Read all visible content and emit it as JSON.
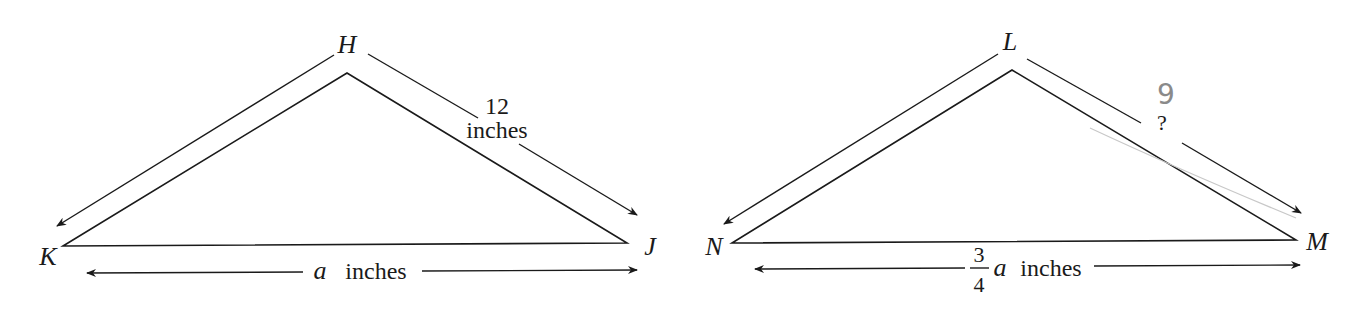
{
  "diagram": {
    "type": "similar-triangles",
    "triangles": [
      {
        "id": "HJK",
        "vertices": {
          "top": "H",
          "left": "K",
          "right": "J"
        },
        "side_labels": {
          "HJ_line1": "12",
          "HJ_line2": "inches",
          "KJ_var": "a",
          "KJ_unit": "inches"
        }
      },
      {
        "id": "LMN",
        "vertices": {
          "top": "L",
          "left": "N",
          "right": "M"
        },
        "side_labels": {
          "LM": "?",
          "LM_handwritten_answer": "9",
          "NM_numerator": "3",
          "NM_denominator": "4",
          "NM_var": "a",
          "NM_unit": "inches"
        }
      }
    ],
    "colors": {
      "ink": "#1a1a1a",
      "pencil": "#8a8a8a",
      "background": "#ffffff"
    }
  }
}
